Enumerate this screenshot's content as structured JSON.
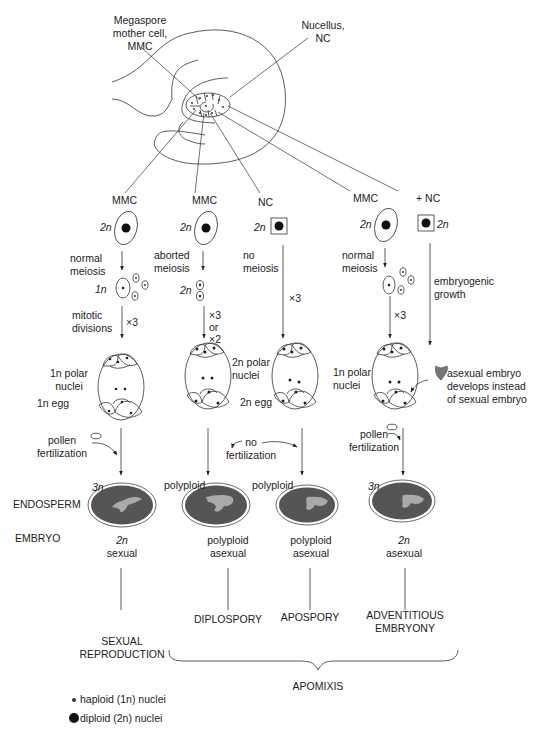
{
  "figure": {
    "ovule_labels": {
      "mmc": [
        "Megaspore",
        "mother cell,",
        "MMC"
      ],
      "nucellus": [
        "Nucellus,",
        "NC"
      ]
    },
    "columns": [
      {
        "id": "sexual",
        "origin": "MMC",
        "origin_ploidy": "2n",
        "step1": [
          "normal",
          "meiosis"
        ],
        "after_step1_ploidy": "1n",
        "step2": [
          "mitotic",
          "divisions"
        ],
        "step2_count": "×3",
        "sac_labels": [
          "1n polar",
          "nuclei",
          "1n egg"
        ],
        "fertilization": [
          "pollen",
          "fertilization"
        ],
        "endosperm_ploidy": "3n",
        "embryo": [
          "2n",
          "sexual"
        ],
        "pathway": [
          "SEXUAL",
          "REPRODUCTION"
        ]
      },
      {
        "id": "diplospory",
        "origin": "MMC",
        "origin_ploidy": "2n",
        "step1": [
          "aborted",
          "meiosis"
        ],
        "after_step1_ploidy": "2n",
        "step2_count": [
          "×3",
          "or",
          "×2"
        ],
        "sac_labels": [
          "2n polar",
          "nuclei"
        ],
        "endosperm_ploidy": "polyploid",
        "embryo": [
          "polyploid",
          "asexual"
        ],
        "pathway": [
          "DIPLOSPORY"
        ]
      },
      {
        "id": "apospory",
        "origin": "NC",
        "origin_ploidy": "2n",
        "step1": [
          "no",
          "meiosis"
        ],
        "step2_count": "×3",
        "sac_labels": [
          "2n egg"
        ],
        "fertilization": [
          "no",
          "fertilization"
        ],
        "endosperm_ploidy": "polyploid",
        "embryo": [
          "polyploid",
          "asexual"
        ],
        "pathway": [
          "APOSPORY"
        ]
      },
      {
        "id": "adventitious",
        "origin": "MMC",
        "origin_extra": "+ NC",
        "origin_ploidy": "2n",
        "step1": [
          "normal",
          "meiosis"
        ],
        "step2_count": "×3",
        "nc_step": [
          "embryogenic",
          "growth"
        ],
        "sac_labels": [
          "1n polar",
          "nuclei"
        ],
        "asexual_note": [
          "asexual embryo",
          "develops instead",
          "of sexual embryo"
        ],
        "fertilization": [
          "pollen",
          "fertilization"
        ],
        "endosperm_ploidy": "3n",
        "embryo": [
          "2n",
          "asexual"
        ],
        "pathway": [
          "ADVENTITIOUS",
          "EMBRYONY"
        ]
      }
    ],
    "row_labels": {
      "endosperm": "ENDOSPERM",
      "embryo": "EMBRYO"
    },
    "group_label": "APOMIXIS",
    "legend": [
      {
        "symbol": "small-dot",
        "text": "haploid (1n) nuclei"
      },
      {
        "symbol": "large-dot",
        "text": "diploid (2n) nuclei"
      }
    ],
    "colors": {
      "ink": "#222222",
      "seed_fill": "#555555",
      "embryo_fill": "#a9a9a9"
    }
  }
}
